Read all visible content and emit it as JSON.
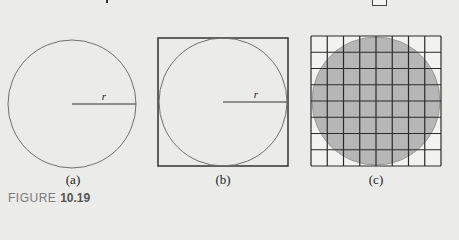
{
  "figure": {
    "caption_prefix": "FIGURE",
    "caption_number": "10.19",
    "panels": [
      {
        "id": "a",
        "label": "(a)",
        "shape": "circle",
        "radius_label": "r"
      },
      {
        "id": "b",
        "label": "(b)",
        "shape": "circle inscribed in square",
        "radius_label": "r"
      },
      {
        "id": "c",
        "label": "(c)",
        "shape": "shaded circle over 8x8 grid",
        "grid_rows": 8,
        "grid_cols": 8
      }
    ],
    "colors": {
      "background": "#ebebea",
      "stroke": "#333333",
      "circle_stroke": "#6e6e6e",
      "shade": "#b6b6b6"
    }
  }
}
